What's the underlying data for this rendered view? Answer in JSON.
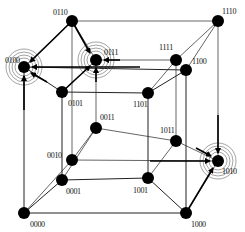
{
  "diagram": {
    "type": "4D hypercube (tesseract) with binary node labels",
    "nodes": [
      {
        "id": "0000",
        "label": "0000",
        "x": 24,
        "y": 213,
        "lx": 30,
        "ly": 227
      },
      {
        "id": "0001",
        "label": "0001",
        "x": 62,
        "y": 180,
        "lx": 66,
        "ly": 194
      },
      {
        "id": "0010",
        "label": "0010",
        "x": 72,
        "y": 160,
        "lx": 47,
        "ly": 158
      },
      {
        "id": "0011",
        "label": "0011",
        "x": 96,
        "y": 128,
        "lx": 100,
        "ly": 120
      },
      {
        "id": "0100",
        "label": "0100",
        "x": 24,
        "y": 67,
        "lx": 5,
        "ly": 63
      },
      {
        "id": "0101",
        "label": "0101",
        "x": 62,
        "y": 92,
        "lx": 68,
        "ly": 106
      },
      {
        "id": "0110",
        "label": "0110",
        "x": 72,
        "y": 21,
        "lx": 53,
        "ly": 15
      },
      {
        "id": "0111",
        "label": "0111",
        "x": 96,
        "y": 60,
        "lx": 104,
        "ly": 55
      },
      {
        "id": "1000",
        "label": "1000",
        "x": 186,
        "y": 213,
        "lx": 191,
        "ly": 227
      },
      {
        "id": "1001",
        "label": "1001",
        "x": 148,
        "y": 178,
        "lx": 133,
        "ly": 193
      },
      {
        "id": "1010",
        "label": "1010",
        "x": 218,
        "y": 161,
        "lx": 222,
        "ly": 174
      },
      {
        "id": "1011",
        "label": "1011",
        "x": 176,
        "y": 141,
        "lx": 160,
        "ly": 133
      },
      {
        "id": "1100",
        "label": "1100",
        "x": 186,
        "y": 70,
        "lx": 192,
        "ly": 64
      },
      {
        "id": "1101",
        "label": "1101",
        "x": 148,
        "y": 93,
        "lx": 133,
        "ly": 107
      },
      {
        "id": "1110",
        "label": "1110",
        "x": 218,
        "y": 21,
        "lx": 222,
        "ly": 14
      },
      {
        "id": "1111",
        "label": "1111",
        "x": 176,
        "y": 60,
        "lx": 159,
        "ly": 50
      }
    ],
    "highlighted_nodes": [
      "0100",
      "0111",
      "1010"
    ],
    "arrows": [
      {
        "from": [
          72,
          21
        ],
        "to": [
          30,
          62
        ]
      },
      {
        "from": [
          140,
          67
        ],
        "to": [
          32,
          67
        ]
      },
      {
        "from": [
          24,
          110
        ],
        "to": [
          24,
          76
        ]
      },
      {
        "from": [
          47,
          82
        ],
        "to": [
          31,
          73
        ]
      },
      {
        "from": [
          72,
          21
        ],
        "to": [
          90,
          53
        ]
      },
      {
        "from": [
          120,
          60
        ],
        "to": [
          104,
          60
        ]
      },
      {
        "from": [
          96,
          82
        ],
        "to": [
          96,
          68
        ]
      },
      {
        "from": [
          62,
          92
        ],
        "to": [
          90,
          66
        ]
      },
      {
        "from": [
          218,
          115
        ],
        "to": [
          218,
          153
        ]
      },
      {
        "from": [
          150,
          161
        ],
        "to": [
          210,
          161
        ]
      },
      {
        "from": [
          196,
          148
        ],
        "to": [
          211,
          156
        ]
      },
      {
        "from": [
          186,
          213
        ],
        "to": [
          213,
          168
        ]
      }
    ],
    "colors": {
      "node": "#000000",
      "edge": "#222222",
      "ring": "#666666",
      "background": "#ffffff"
    }
  }
}
